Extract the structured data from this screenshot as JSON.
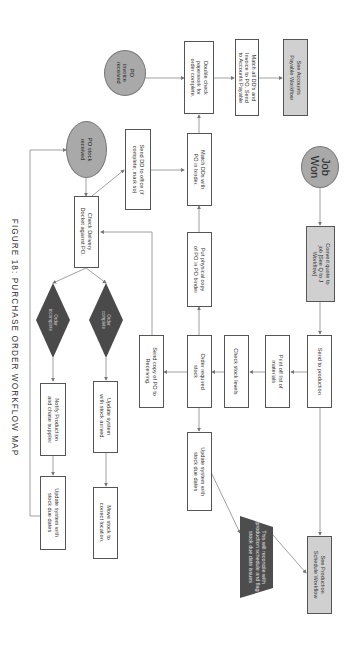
{
  "figure": {
    "caption": "FIGURE 18: PURCHASE ORDER WORKFLOW MAP",
    "orientation": "rotated 90 degrees clockwise"
  },
  "nodes": {
    "job_won": "Job\nWon",
    "convert_quote": "Convert quote to\njob [See Q to J\nWorkflow]",
    "send_production": "Send to production",
    "print_materials": "Print off list of\nmaterials",
    "check_stock": "Check stock levels",
    "order_stock": "Order required\nstock",
    "send_copy_po": "Send copy of PO to\nReceiving.",
    "update_due_dates_1": "Update system with\nstock due dates",
    "note_reconcile": "This will reconcile with\nproduction schedule and flag\nstock due date issues",
    "see_production": "See Production\nSchedule Workflow",
    "put_physical_copy": "Put physical copy\nof PO in PO binder",
    "match_dds": "Match DDs with\nPO in binder.",
    "double_check": "Double check\npaperwork for\norder complete.",
    "match_invoice": "Match all DD's and\nInvoice to PO. Send\nto Accounts Payable",
    "see_accounts": "See Accounts\nPayable Workflow",
    "po_invoice": "PO\ninvoice\nreceived",
    "po_stock": "PO stock\nreceived",
    "send_dd_office": "Send DD to office (if\ncomplete, mark so)",
    "check_delivery": "Check Delivery\nDocket against PO.",
    "order_complete": "Order\ncomplete",
    "order_incomplete": "Order\nincomplete",
    "update_stock_arrived": "Update system\nwith stock arrived.",
    "move_stock": "Move stock to\ncorrect location.",
    "notify_production": "Notify Production\nand chase supplier",
    "update_due_dates_2": "Update system with\nstock due dates"
  },
  "colors": {
    "terminal_fill": "#a9a9a9",
    "highlight_fill": "#d0d0d0",
    "decision_fill": "#4a4a4a",
    "note_fill": "#4d4d4d",
    "line": "#777777"
  }
}
